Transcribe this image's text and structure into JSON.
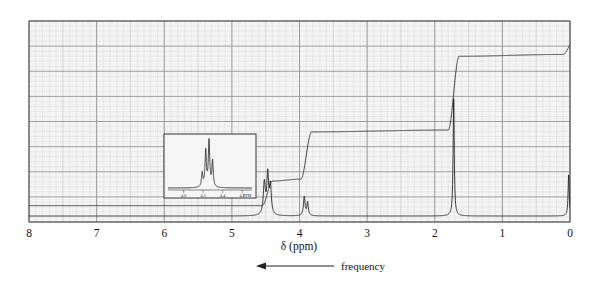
{
  "figure": {
    "kind": "nmr-spectrum",
    "axis_label": "δ (ppm)",
    "direction_label": "frequency",
    "direction_arrow": "left"
  },
  "axis": {
    "ticks": [
      "8",
      "7",
      "6",
      "5",
      "4",
      "3",
      "2",
      "1",
      "0"
    ],
    "xmin_ppm": 0,
    "xmax_ppm": 8,
    "reversed": true
  },
  "inset": {
    "ticks": [
      "4.6",
      "4.5",
      "4.4",
      "4.3"
    ],
    "unit_label": "PPM",
    "xmin_ppm": 4.25,
    "xmax_ppm": 4.68
  },
  "colors": {
    "trace": "#1a1a1a",
    "integral": "#2a2a2a",
    "grid_major": "#8a8a8a",
    "grid_minor": "#c8c8c8",
    "grid_fine": "#dcdcdc",
    "frame": "#555555",
    "paper": "#f4f4f4",
    "text": "#111111"
  },
  "chart_data": {
    "type": "line",
    "title": "",
    "xlabel": "δ (ppm)",
    "ylabel": "",
    "xlim": [
      8,
      0
    ],
    "ylim": [
      0,
      1
    ],
    "grid": true,
    "legend": "none",
    "series": [
      {
        "name": "spectrum",
        "peaks": [
          {
            "ppm": 4.52,
            "height": 0.17,
            "width": 0.018,
            "label": "multiplet (expanded in inset)"
          },
          {
            "ppm": 4.47,
            "height": 0.21,
            "width": 0.016,
            "label": "multiplet"
          },
          {
            "ppm": 4.43,
            "height": 0.15,
            "width": 0.016,
            "label": "multiplet"
          },
          {
            "ppm": 3.93,
            "height": 0.1,
            "width": 0.014,
            "label": "singlet"
          },
          {
            "ppm": 3.88,
            "height": 0.07,
            "width": 0.013,
            "label": "singlet"
          },
          {
            "ppm": 1.72,
            "height": 0.62,
            "width": 0.01,
            "label": "tall singlet"
          },
          {
            "ppm": 0.02,
            "height": 0.22,
            "width": 0.01,
            "label": "TMS reference"
          }
        ]
      },
      {
        "name": "integral",
        "steps": [
          {
            "ppm": 8.0,
            "level": 0.055
          },
          {
            "ppm": 4.55,
            "level": 0.055
          },
          {
            "ppm": 4.4,
            "level": 0.185
          },
          {
            "ppm": 3.98,
            "level": 0.195
          },
          {
            "ppm": 3.82,
            "level": 0.445
          },
          {
            "ppm": 1.8,
            "level": 0.455
          },
          {
            "ppm": 1.64,
            "level": 0.845
          },
          {
            "ppm": 0.1,
            "level": 0.855
          },
          {
            "ppm": -0.05,
            "level": 0.925
          }
        ]
      }
    ],
    "inset_series": {
      "name": "expansion-4.3-4.6",
      "peaks": [
        {
          "ppm": 4.505,
          "height": 0.28
        },
        {
          "ppm": 4.487,
          "height": 0.72
        },
        {
          "ppm": 4.47,
          "height": 0.92
        },
        {
          "ppm": 4.452,
          "height": 0.52
        }
      ]
    }
  }
}
